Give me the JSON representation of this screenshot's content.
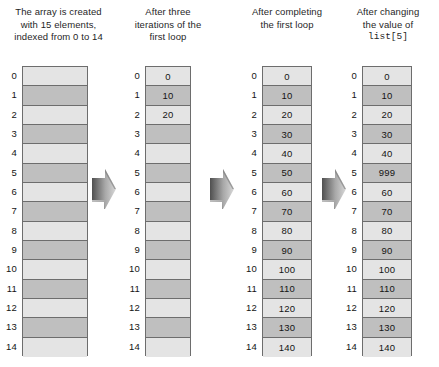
{
  "figure": {
    "row_count": 15,
    "colors": {
      "cell_light": "#e4e4e4",
      "cell_dark": "#bfbfbf",
      "border": "#6d6d6d",
      "text": "#141414",
      "arrow_dark": "#4f4f4f",
      "arrow_light": "#d8d8d8",
      "background": "#ffffff"
    }
  },
  "columns": [
    {
      "id": "initial",
      "caption_lines": [
        "The array is created",
        "with 15 elements,",
        "indexed from 0 to 14"
      ],
      "caption_mono_line": null,
      "indices": [
        "0",
        "1",
        "2",
        "3",
        "4",
        "5",
        "6",
        "7",
        "8",
        "9",
        "10",
        "11",
        "12",
        "13",
        "14"
      ],
      "values": [
        "",
        "",
        "",
        "",
        "",
        "",
        "",
        "",
        "",
        "",
        "",
        "",
        "",
        "",
        ""
      ]
    },
    {
      "id": "after-three-iterations",
      "caption_lines": [
        "After three",
        "iterations of the",
        "first loop"
      ],
      "caption_mono_line": null,
      "indices": [
        "0",
        "1",
        "2",
        "3",
        "4",
        "5",
        "6",
        "7",
        "8",
        "9",
        "10",
        "11",
        "12",
        "13",
        "14"
      ],
      "values": [
        "0",
        "10",
        "20",
        "",
        "",
        "",
        "",
        "",
        "",
        "",
        "",
        "",
        "",
        "",
        ""
      ]
    },
    {
      "id": "after-first-loop",
      "caption_lines": [
        "After completing",
        "the first loop"
      ],
      "caption_mono_line": null,
      "indices": [
        "0",
        "1",
        "2",
        "3",
        "4",
        "5",
        "6",
        "7",
        "8",
        "9",
        "10",
        "11",
        "12",
        "13",
        "14"
      ],
      "values": [
        "0",
        "10",
        "20",
        "30",
        "40",
        "50",
        "60",
        "70",
        "80",
        "90",
        "100",
        "110",
        "120",
        "130",
        "140"
      ]
    },
    {
      "id": "after-changing-value",
      "caption_lines": [
        "After changing",
        "the value of"
      ],
      "caption_mono_line": "list[5]",
      "indices": [
        "0",
        "1",
        "2",
        "3",
        "4",
        "5",
        "6",
        "7",
        "8",
        "9",
        "10",
        "11",
        "12",
        "13",
        "14"
      ],
      "values": [
        "0",
        "10",
        "20",
        "30",
        "40",
        "999",
        "60",
        "70",
        "80",
        "90",
        "100",
        "110",
        "120",
        "130",
        "140"
      ]
    }
  ],
  "arrows": [
    {
      "id": "arrow-1",
      "label": "right-arrow"
    },
    {
      "id": "arrow-2",
      "label": "right-arrow"
    },
    {
      "id": "arrow-3",
      "label": "right-arrow"
    }
  ]
}
